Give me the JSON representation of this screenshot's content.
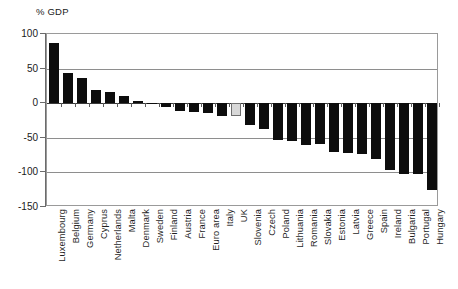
{
  "chart_data": {
    "type": "bar",
    "title": "% GDP",
    "xlabel": "",
    "ylabel": "% GDP",
    "ylim": [
      -150,
      100
    ],
    "yticks": [
      100,
      50,
      0,
      -50,
      -100,
      -150
    ],
    "ytick_labels": [
      "100",
      "50",
      "0",
      "-50",
      "-100",
      "-150"
    ],
    "grid": true,
    "legend": "none",
    "highlight_category": "UK",
    "highlight_color": "#d8d8d8",
    "bar_color": "#0d0d0d",
    "categories": [
      "Luxembourg",
      "Belgium",
      "Germany",
      "Cyprus",
      "Netherlands",
      "Malta",
      "Denmark",
      "Sweden",
      "Finland",
      "Austria",
      "France",
      "Euro area",
      "Italy",
      "UK",
      "Slovenia",
      "Czech",
      "Poland",
      "Lithuania",
      "Romania",
      "Slovakia",
      "Estonia",
      "Latvia",
      "Greece",
      "Spain",
      "Ireland",
      "Bulgaria",
      "Portugal",
      "Hungary"
    ],
    "values": [
      87,
      44,
      37,
      19,
      16,
      11,
      3,
      1,
      -6,
      -12,
      -13,
      -14,
      -19,
      -19,
      -32,
      -38,
      -53,
      -55,
      -60,
      -59,
      -71,
      -72,
      -74,
      -80,
      -96,
      -102,
      -103,
      -125
    ]
  },
  "axis": {
    "title": "% GDP"
  }
}
